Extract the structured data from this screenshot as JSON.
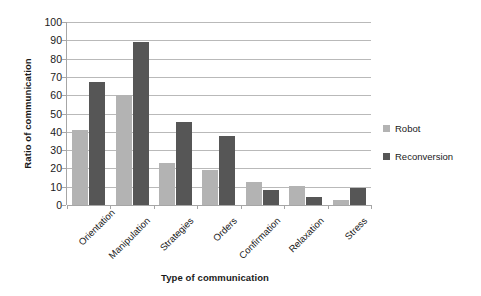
{
  "chart_data": {
    "type": "bar",
    "title": "",
    "xlabel": "Type of communication",
    "ylabel": "Ratio of communication",
    "categories": [
      "Orientation",
      "Manipulation",
      "Strategies",
      "Orders",
      "Confirmation",
      "Relaxation",
      "Stress"
    ],
    "series": [
      {
        "name": "Robot",
        "color": "#b3b3b3",
        "values": [
          41,
          60,
          23,
          19,
          12.5,
          10.5,
          2.5
        ]
      },
      {
        "name": "Reconversion",
        "color": "#565656",
        "values": [
          67,
          89,
          45.5,
          37.5,
          8,
          4.5,
          9.5
        ]
      }
    ],
    "ylim": [
      0,
      100
    ],
    "y_ticks": [
      0,
      10,
      20,
      30,
      40,
      50,
      60,
      70,
      80,
      90,
      100
    ],
    "y_tick_labels": [
      "0",
      "10",
      "20",
      "30",
      "40",
      "50",
      "60",
      "70",
      "80",
      "90",
      "100"
    ],
    "grid": true,
    "grid_axis": "y",
    "legend_position": "right",
    "legend_entries": [
      "Robot",
      "Reconversion"
    ],
    "bar_orientation": "vertical",
    "x_tick_label_rotation": -45
  },
  "axes": {
    "y_title": "Ratio of communication",
    "x_title": "Type of communication"
  },
  "legend": {
    "items": [
      {
        "label": "Robot",
        "color": "#b3b3b3"
      },
      {
        "label": "Reconversion",
        "color": "#565656"
      }
    ]
  },
  "colors": {
    "robot": "#b3b3b3",
    "reconversion": "#565656",
    "gridline": "#b9b9b9",
    "axis": "#a6a6a6",
    "text": "#1a1a1a",
    "background": "#ffffff"
  }
}
